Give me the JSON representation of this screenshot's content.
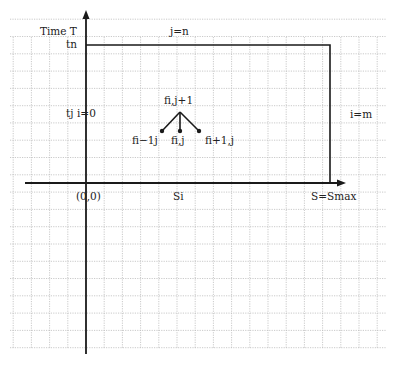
{
  "diagram": {
    "type": "finite-difference-grid",
    "axes": {
      "vertical_label": "Time T",
      "horizontal_label_end": "S=Smax",
      "origin_label": "(0,0)"
    },
    "labels": {
      "tn": "tn",
      "j_eq_n": "j=n",
      "tj": "tj",
      "i_eq_0": "i=0",
      "i_eq_m": "i=m",
      "si": "Si"
    },
    "stencil": {
      "top": "fi,j+1",
      "left": "fi−1j",
      "center": "fi,j",
      "right": "fi+1,j"
    },
    "colors": {
      "line": "#1a1a1a",
      "grid": "#bdbdbd",
      "text": "#222222"
    }
  }
}
